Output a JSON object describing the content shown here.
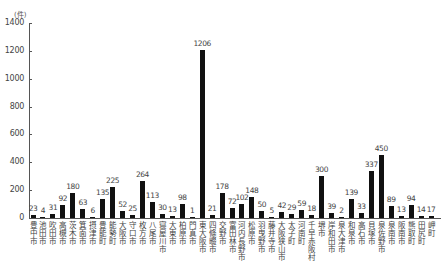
{
  "chart_data": {
    "type": "bar",
    "title": "",
    "unit_label": "(件)",
    "xlabel": "",
    "ylabel": "(件)",
    "ylim": [
      0,
      1400
    ],
    "yticks": [
      0,
      200,
      400,
      600,
      800,
      1000,
      1200,
      1400
    ],
    "grid": false,
    "legend": null,
    "categories": [
      "豊中市",
      "池田市",
      "吹田市",
      "高槻市",
      "茨木市",
      "箕面市",
      "摂津市",
      "豊能町",
      "能勢町",
      "大阪市",
      "守口市",
      "枚方市",
      "八尾市",
      "寝屋川市",
      "大東市",
      "柏原市",
      "門真市",
      "東大阪市",
      "四條畷市",
      "交野市",
      "富田林市",
      "河内長野市",
      "松原市",
      "羽曳野市",
      "藤井寺市",
      "大阪狭山市",
      "太子町",
      "河南町",
      "千早赤阪村",
      "堺市",
      "岸和田市",
      "泉大津市",
      "和泉市",
      "高石市",
      "貝塚市",
      "泉佐野市",
      "泉南市",
      "阪南市",
      "熊取町",
      "田尻町",
      "岬町"
    ],
    "values": [
      23,
      4,
      31,
      92,
      180,
      63,
      6,
      135,
      225,
      52,
      25,
      264,
      113,
      30,
      13,
      98,
      1,
      1206,
      21,
      178,
      72,
      102,
      148,
      50,
      5,
      42,
      29,
      59,
      18,
      300,
      39,
      2,
      139,
      33,
      337,
      450,
      89,
      13,
      94,
      14,
      17
    ]
  },
  "colors": {
    "bar": "#111111",
    "axis": "#555555",
    "text": "#444444"
  }
}
